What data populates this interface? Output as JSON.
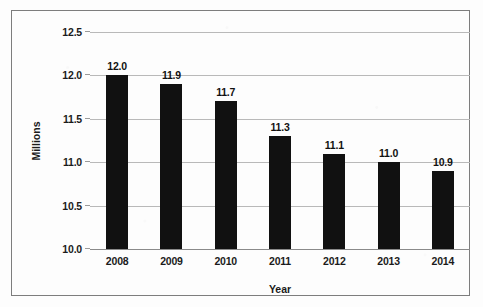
{
  "chart_data": {
    "type": "bar",
    "title": "",
    "subtitle": "",
    "xlabel": "Year",
    "ylabel": "Millions",
    "categories": [
      "2008",
      "2009",
      "2010",
      "2011",
      "2012",
      "2013",
      "2014"
    ],
    "values": [
      12.0,
      11.9,
      11.7,
      11.3,
      11.1,
      11.0,
      10.9
    ],
    "data_labels": [
      "12.0",
      "11.9",
      "11.7",
      "11.3",
      "11.1",
      "11.0",
      "10.9"
    ],
    "ylim": [
      10.0,
      12.5
    ],
    "ytick_values": [
      10.0,
      10.5,
      11.0,
      11.5,
      12.0,
      12.5
    ],
    "ytick_labels": [
      "10.0",
      "10.5",
      "11.0",
      "11.5",
      "12.0",
      "12.5"
    ],
    "grid": true,
    "grid_axis": "y",
    "legend": false,
    "legend_position": "none",
    "series": [
      {
        "name": "Millions",
        "values": [
          12.0,
          11.9,
          11.7,
          11.3,
          11.1,
          11.0,
          10.9
        ]
      }
    ],
    "colors": {
      "bar": "#111111",
      "gridline": "#b9b9b9",
      "axis": "#8a8a8a",
      "text": "#1b1b1b",
      "frame": "#7d7d7d",
      "background": "#fdfdfd"
    }
  }
}
